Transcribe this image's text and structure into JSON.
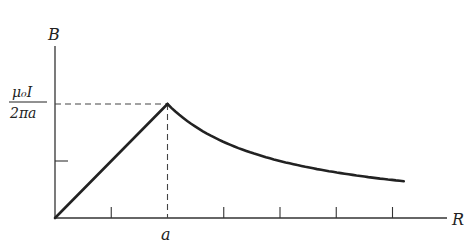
{
  "chart_data": {
    "type": "line",
    "title": "",
    "ylabel": "B",
    "xlabel": "R",
    "y_ticks": [
      {
        "value": 1.0,
        "label_num": "μ₀I",
        "label_den": "2πa"
      },
      {
        "value": 0.5,
        "label": ""
      }
    ],
    "x_ticks": [
      {
        "value": 0.5,
        "label": ""
      },
      {
        "value": 1.0,
        "label": "a"
      },
      {
        "value": 1.5,
        "label": ""
      },
      {
        "value": 2.0,
        "label": ""
      },
      {
        "value": 2.5,
        "label": ""
      },
      {
        "value": 3.0,
        "label": ""
      }
    ],
    "xlim": [
      0,
      3.5
    ],
    "ylim": [
      0,
      1.5
    ],
    "series": [
      {
        "name": "inside (B ∝ r)",
        "x": [
          0,
          1.0
        ],
        "y": [
          0,
          1.0
        ],
        "law": "linear"
      },
      {
        "name": "outside (B ∝ 1/r)",
        "x_range": [
          1.0,
          3.1
        ],
        "law": "inverse"
      }
    ],
    "guides": {
      "peak_x": 1.0,
      "peak_y": 1.0,
      "style": "dashed"
    }
  }
}
